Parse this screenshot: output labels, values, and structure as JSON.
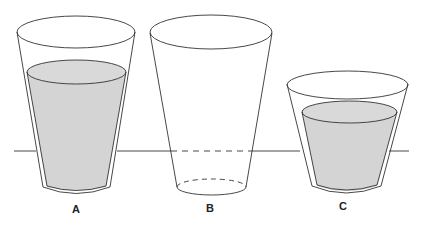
{
  "diagram": {
    "colors": {
      "stroke": "#333333",
      "water": "#d4d4d4",
      "background": "#ffffff"
    },
    "glasses": [
      {
        "id": "A",
        "label": "A",
        "state": "filled with liquid"
      },
      {
        "id": "B",
        "label": "B",
        "state": "empty, bottom below line (dashed hidden edges)"
      },
      {
        "id": "C",
        "label": "C",
        "state": "filled with liquid, shorter glass"
      }
    ]
  }
}
